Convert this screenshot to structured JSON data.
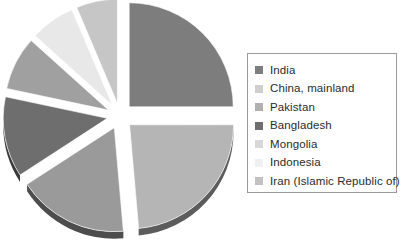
{
  "chart_data": {
    "type": "pie",
    "title": "",
    "subtitle": "",
    "exploded": true,
    "three_d": true,
    "legend_position": "right",
    "grid": false,
    "value_unit": "percent",
    "categories": [
      "India",
      "China, mainland",
      "Pakistan",
      "Bangladesh",
      "Mongolia",
      "Indonesia",
      "Iran (Islamic Republic of)"
    ],
    "values": [
      25.0,
      23.6,
      17.2,
      12.5,
      8.3,
      6.9,
      6.5
    ],
    "colors": [
      "#7d7d7d",
      "#b5b5b5",
      "#9a9a9a",
      "#6e6e6e",
      "#a0a0a0",
      "#e8e8e8",
      "#c6c6c6"
    ],
    "slices": [
      {
        "label": "India",
        "value": 25.0,
        "color": "#7d7d7d",
        "side_color": "#3f3f3f",
        "start_angle": 0,
        "end_angle": 90,
        "explode": 13
      },
      {
        "label": "China, mainland",
        "value": 23.6,
        "color": "#b5b5b5",
        "side_color": "#5c5c5c",
        "start_angle": 90,
        "end_angle": 175,
        "explode": 13
      },
      {
        "label": "Pakistan",
        "value": 17.2,
        "color": "#9a9a9a",
        "side_color": "#4d4d4d",
        "start_angle": 175,
        "end_angle": 237,
        "explode": 13
      },
      {
        "label": "Bangladesh",
        "value": 12.5,
        "color": "#6e6e6e",
        "side_color": "#3a3a3a",
        "start_angle": 237,
        "end_angle": 282,
        "explode": 13
      },
      {
        "label": "Mongolia",
        "value": 8.3,
        "color": "#a0a0a0",
        "side_color": "#4f4f4f",
        "start_angle": 282,
        "end_angle": 312,
        "explode": 13
      },
      {
        "label": "Indonesia",
        "value": 6.9,
        "color": "#e8e8e8",
        "side_color": "#8a8a8a",
        "start_angle": 312,
        "end_angle": 337,
        "explode": 13
      },
      {
        "label": "Iran (Islamic Republic of)",
        "value": 6.5,
        "color": "#c6c6c6",
        "side_color": "#6a6a6a",
        "start_angle": 337,
        "end_angle": 360,
        "explode": 13
      }
    ],
    "geometry": {
      "center_x": 120,
      "center_y": 116,
      "radius_x": 104,
      "radius_y": 104,
      "depth": 7
    }
  },
  "legend": {
    "border_color": "#9b9b9b",
    "items": [
      {
        "label": "India",
        "color": "#7d7d7d"
      },
      {
        "label": "China, mainland",
        "color": "#cfcfcf"
      },
      {
        "label": "Pakistan",
        "color": "#b0b0b0"
      },
      {
        "label": "Bangladesh",
        "color": "#6e6e6e"
      },
      {
        "label": "Mongolia",
        "color": "#d8d8d8"
      },
      {
        "label": "Indonesia",
        "color": "#f0f0f0"
      },
      {
        "label": "Iran (Islamic Republic of)",
        "color": "#c2c2c2"
      }
    ]
  }
}
